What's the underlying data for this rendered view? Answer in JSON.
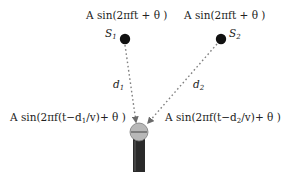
{
  "diagram": {
    "sources": [
      {
        "id": "S1",
        "label": "S",
        "label_sub": "1",
        "signal": "A sin(2πft + θ )"
      },
      {
        "id": "S2",
        "label": "S",
        "label_sub": "2",
        "signal": "A sin(2πft + θ )"
      }
    ],
    "paths": [
      {
        "from": "S1",
        "to": "microphone",
        "distance_label": "d",
        "distance_sub": "1"
      },
      {
        "from": "S2",
        "to": "microphone",
        "distance_label": "d",
        "distance_sub": "2"
      }
    ],
    "received_signals": [
      {
        "from": "S1",
        "text": "A sin(2πf(t−d",
        "sub": "1",
        "tail": "/v)+ θ )"
      },
      {
        "from": "S2",
        "text": "A sin(2πf(t−d",
        "sub": "2",
        "tail": "/v)+ θ )"
      }
    ],
    "receiver": {
      "icon": "microphone-icon"
    },
    "colors": {
      "source_dot": "#111111",
      "arrow": "#777777",
      "mic_head": "#b5b5b5",
      "mic_body": "#2a2a2a"
    }
  }
}
